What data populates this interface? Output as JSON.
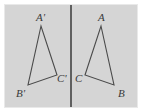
{
  "figure": {
    "background_color": "#d5d5d5",
    "page_color": "#ffffff",
    "stroke_color": "#4a4a4a",
    "mirror_color": "#2e2e2e",
    "label_color": "#3a3a3a",
    "mirror_line": {
      "name": "mirror-line",
      "x": 71,
      "y_start": 5,
      "y_end": 107
    },
    "shapes": [
      {
        "name": "triangle-image",
        "side": "left",
        "points": "41,26 28,85 57,75",
        "vertices": [
          {
            "label": "A'",
            "x": 41,
            "y": 26,
            "label_x": 36,
            "label_y": 21
          },
          {
            "label": "B'",
            "x": 28,
            "y": 85,
            "label_x": 16,
            "label_y": 97
          },
          {
            "label": "C'",
            "x": 57,
            "y": 75,
            "label_x": 57,
            "label_y": 82
          }
        ]
      },
      {
        "name": "triangle-preimage",
        "side": "right",
        "points": "101,26 114,85 85,75",
        "vertices": [
          {
            "label": "A",
            "x": 101,
            "y": 26,
            "label_x": 98,
            "label_y": 21
          },
          {
            "label": "B",
            "x": 114,
            "y": 85,
            "label_x": 118,
            "label_y": 97
          },
          {
            "label": "C",
            "x": 85,
            "y": 75,
            "label_x": 75,
            "label_y": 82
          }
        ]
      }
    ]
  }
}
